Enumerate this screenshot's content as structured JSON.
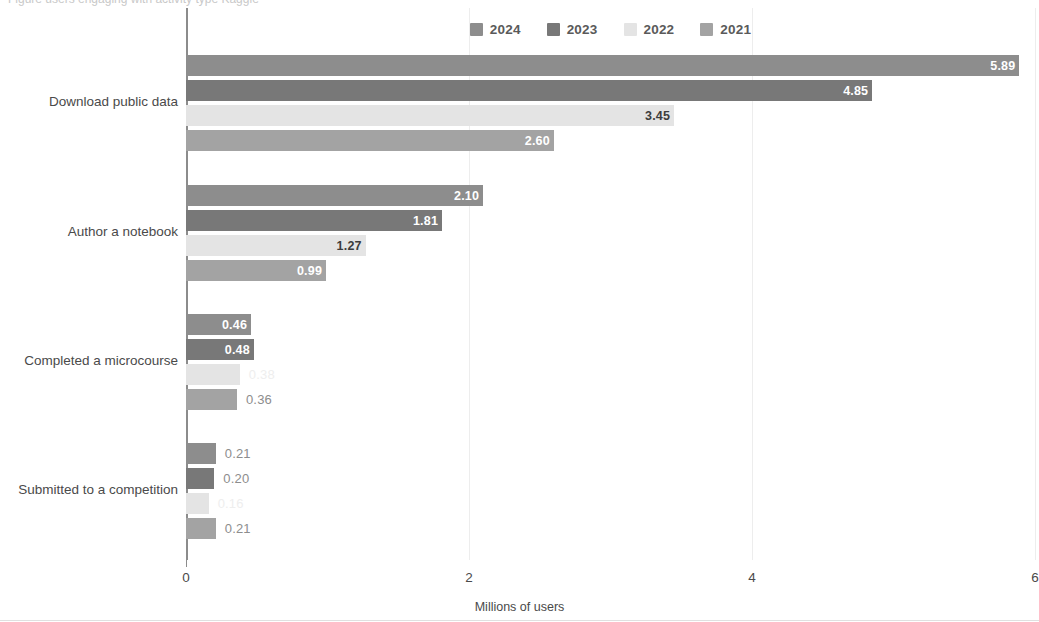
{
  "top_partial_text": "Figure   users engaging with  activity type   Kaggle",
  "legend": {
    "position": "top-center",
    "items": [
      {
        "label": "2024",
        "color": "#8d8d8d"
      },
      {
        "label": "2023",
        "color": "#787878"
      },
      {
        "label": "2022",
        "color": "#e4e4e4"
      },
      {
        "label": "2021",
        "color": "#a3a3a3"
      }
    ]
  },
  "axis": {
    "x_title": "Millions of users",
    "x_ticks": [
      "0",
      "2",
      "4",
      "6"
    ],
    "x_tick_values": [
      0,
      2,
      4,
      6
    ]
  },
  "chart_data": {
    "type": "bar",
    "orientation": "horizontal",
    "title": "",
    "subtitle": "",
    "xlabel": "Millions of users",
    "ylabel": "",
    "xlim": [
      0,
      6
    ],
    "grid": true,
    "legend_position": "top-center",
    "categories": [
      "Download public data",
      "Author a notebook",
      "Completed a microcourse",
      "Submitted to a competition"
    ],
    "series": [
      {
        "name": "2024",
        "color": "#8d8d8d",
        "values": [
          5.89,
          2.1,
          0.46,
          0.21
        ]
      },
      {
        "name": "2023",
        "color": "#787878",
        "values": [
          4.85,
          1.81,
          0.48,
          0.2
        ]
      },
      {
        "name": "2022",
        "color": "#e4e4e4",
        "values": [
          3.45,
          1.27,
          0.38,
          0.16
        ]
      },
      {
        "name": "2021",
        "color": "#a3a3a3",
        "values": [
          2.6,
          0.99,
          0.36,
          0.21
        ]
      }
    ],
    "value_labels": [
      [
        "5.89",
        "4.85",
        "3.45",
        "2.60"
      ],
      [
        "2.10",
        "1.81",
        "1.27",
        "0.99"
      ],
      [
        "0.46",
        "0.48",
        "0.38",
        "0.36"
      ],
      [
        "0.21",
        "0.20",
        "0.16",
        "0.21"
      ]
    ]
  }
}
